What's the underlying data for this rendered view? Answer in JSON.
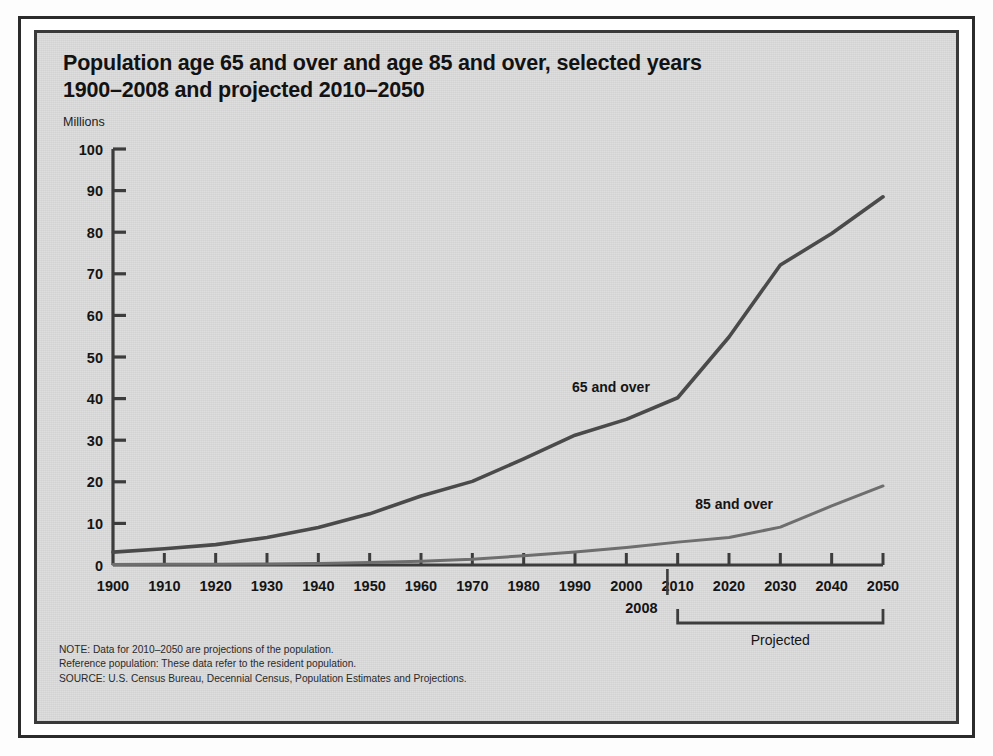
{
  "title": {
    "line1": "Population age 65 and over and age 85 and over, selected years",
    "line2": "1900–2008 and projected 2010–2050"
  },
  "axis_unit_label": "Millions",
  "notes": {
    "note": "NOTE: Data for 2010–2050 are projections of the population.",
    "reference": "Reference population: These data refer to the resident population.",
    "source": "SOURCE: U.S. Census Bureau, Decennial Census, Population Estimates and Projections."
  },
  "annotations": {
    "marker_2008": "2008",
    "projected_bracket": "Projected"
  },
  "colors": {
    "background": "#dcdcdc",
    "frame": "#2b2b2b",
    "series_65": "#4a4a4a",
    "series_85": "#6e6e6e",
    "text": "#141414"
  },
  "chart_data": {
    "type": "line",
    "title": "Population age 65 and over and age 85 and over, selected years 1900–2008 and projected 2010–2050",
    "xlabel": "",
    "ylabel": "Millions",
    "xlim": [
      1900,
      2050
    ],
    "ylim": [
      0,
      100
    ],
    "ytick_step": 10,
    "grid": false,
    "legend": "inline-labels",
    "x": [
      1900,
      1910,
      1920,
      1930,
      1940,
      1950,
      1960,
      1970,
      1980,
      1990,
      2000,
      2010,
      2020,
      2030,
      2040,
      2050
    ],
    "xticks": [
      "1900",
      "1910",
      "1920",
      "1930",
      "1940",
      "1950",
      "1960",
      "1970",
      "1980",
      "1990",
      "2000",
      "2010",
      "2020",
      "2030",
      "2040",
      "2050"
    ],
    "yticks": [
      "0",
      "10",
      "20",
      "30",
      "40",
      "50",
      "60",
      "70",
      "80",
      "90",
      "100"
    ],
    "projection_start": 2010,
    "series": [
      {
        "name": "65 and over",
        "label": "65 and over",
        "values": [
          3.1,
          3.9,
          4.9,
          6.6,
          9.0,
          12.3,
          16.6,
          20.1,
          25.5,
          31.2,
          35.0,
          40.2,
          54.8,
          72.1,
          79.7,
          88.5
        ]
      },
      {
        "name": "85 and over",
        "label": "85 and over",
        "values": [
          0.12,
          0.17,
          0.21,
          0.27,
          0.37,
          0.58,
          0.93,
          1.4,
          2.2,
          3.1,
          4.2,
          5.5,
          6.6,
          9.1,
          14.2,
          19.0
        ]
      }
    ]
  }
}
